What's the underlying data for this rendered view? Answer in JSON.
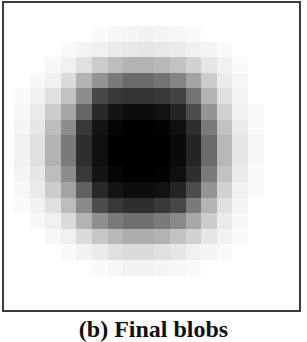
{
  "figure": {
    "caption": "(b) Final blobs",
    "frame_color": "#3a3a3a",
    "grid": {
      "origin_x": 14,
      "origin_y": 26,
      "cell_size": 15.6,
      "rows": 16,
      "cols": 16
    }
  },
  "chart_data": {
    "type": "heatmap",
    "title": "(b) Final blobs",
    "colormap": "gray (0 = white, 1 = black)",
    "values": [
      [
        0.0,
        0.0,
        0.0,
        0.0,
        0.0,
        0.02,
        0.03,
        0.04,
        0.05,
        0.04,
        0.03,
        0.02,
        0.0,
        0.0,
        0.0,
        0.0
      ],
      [
        0.0,
        0.0,
        0.0,
        0.02,
        0.04,
        0.06,
        0.08,
        0.09,
        0.1,
        0.09,
        0.08,
        0.06,
        0.04,
        0.02,
        0.0,
        0.0
      ],
      [
        0.0,
        0.0,
        0.03,
        0.06,
        0.12,
        0.2,
        0.26,
        0.3,
        0.3,
        0.28,
        0.24,
        0.18,
        0.1,
        0.05,
        0.02,
        0.0
      ],
      [
        0.0,
        0.03,
        0.06,
        0.14,
        0.3,
        0.42,
        0.52,
        0.58,
        0.58,
        0.55,
        0.48,
        0.36,
        0.2,
        0.08,
        0.03,
        0.0
      ],
      [
        0.02,
        0.05,
        0.12,
        0.24,
        0.45,
        0.72,
        0.78,
        0.8,
        0.8,
        0.78,
        0.74,
        0.55,
        0.3,
        0.12,
        0.04,
        0.0
      ],
      [
        0.03,
        0.08,
        0.2,
        0.35,
        0.6,
        0.84,
        0.92,
        0.95,
        0.95,
        0.93,
        0.86,
        0.7,
        0.42,
        0.18,
        0.06,
        0.02
      ],
      [
        0.04,
        0.1,
        0.26,
        0.45,
        0.78,
        0.92,
        0.98,
        1.0,
        1.0,
        0.99,
        0.94,
        0.82,
        0.52,
        0.24,
        0.08,
        0.02
      ],
      [
        0.05,
        0.12,
        0.3,
        0.52,
        0.82,
        0.94,
        1.0,
        1.0,
        1.0,
        1.0,
        0.96,
        0.86,
        0.58,
        0.28,
        0.1,
        0.03
      ],
      [
        0.05,
        0.12,
        0.3,
        0.52,
        0.82,
        0.94,
        1.0,
        1.0,
        1.0,
        1.0,
        0.96,
        0.86,
        0.58,
        0.28,
        0.1,
        0.03
      ],
      [
        0.04,
        0.1,
        0.26,
        0.45,
        0.78,
        0.92,
        0.98,
        1.0,
        1.0,
        0.99,
        0.94,
        0.82,
        0.52,
        0.24,
        0.08,
        0.02
      ],
      [
        0.03,
        0.08,
        0.2,
        0.36,
        0.62,
        0.84,
        0.92,
        0.95,
        0.95,
        0.93,
        0.86,
        0.7,
        0.42,
        0.18,
        0.06,
        0.02
      ],
      [
        0.02,
        0.05,
        0.12,
        0.26,
        0.46,
        0.7,
        0.78,
        0.82,
        0.82,
        0.78,
        0.72,
        0.52,
        0.3,
        0.12,
        0.04,
        0.0
      ],
      [
        0.0,
        0.03,
        0.06,
        0.14,
        0.3,
        0.44,
        0.52,
        0.56,
        0.56,
        0.52,
        0.46,
        0.34,
        0.2,
        0.08,
        0.03,
        0.0
      ],
      [
        0.0,
        0.0,
        0.03,
        0.06,
        0.14,
        0.22,
        0.28,
        0.32,
        0.32,
        0.3,
        0.24,
        0.18,
        0.1,
        0.05,
        0.02,
        0.0
      ],
      [
        0.0,
        0.0,
        0.0,
        0.02,
        0.05,
        0.08,
        0.12,
        0.14,
        0.14,
        0.12,
        0.1,
        0.06,
        0.04,
        0.02,
        0.0,
        0.0
      ],
      [
        0.0,
        0.0,
        0.0,
        0.0,
        0.0,
        0.02,
        0.03,
        0.05,
        0.05,
        0.04,
        0.03,
        0.02,
        0.0,
        0.0,
        0.0,
        0.0
      ]
    ],
    "xlabel": "",
    "ylabel": "",
    "grid": false,
    "legend": false
  }
}
